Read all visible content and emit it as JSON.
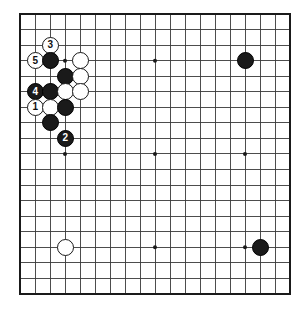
{
  "diagram": {
    "board_size": 19,
    "colors": {
      "background": "#ffffff",
      "grid_line": "#3a3a3a",
      "border_line": "#1a1a1a",
      "black_stone": "#1a1a1a",
      "white_stone": "#ffffff",
      "stone_outline": "#1a1a1a",
      "star_point": "#1a1a1a",
      "black_label_text": "#ffffff",
      "white_label_text": "#111111"
    },
    "geometry": {
      "origin_x": 20,
      "origin_y": 14,
      "step_x": 15.0,
      "step_y": 15.55,
      "stone_diameter": 17,
      "star_diameter": 4,
      "border_width": 2.2,
      "grid_width": 0.9
    },
    "star_points": [
      {
        "col": 4,
        "row": 4
      },
      {
        "col": 10,
        "row": 4
      },
      {
        "col": 16,
        "row": 4
      },
      {
        "col": 4,
        "row": 10
      },
      {
        "col": 10,
        "row": 10
      },
      {
        "col": 16,
        "row": 10
      },
      {
        "col": 4,
        "row": 16
      },
      {
        "col": 10,
        "row": 16
      },
      {
        "col": 16,
        "row": 16
      }
    ],
    "stones": [
      {
        "col": 3,
        "row": 3,
        "color": "white",
        "label": "3"
      },
      {
        "col": 2,
        "row": 4,
        "color": "white",
        "label": "5"
      },
      {
        "col": 3,
        "row": 4,
        "color": "black",
        "label": ""
      },
      {
        "col": 5,
        "row": 4,
        "color": "white",
        "label": ""
      },
      {
        "col": 4,
        "row": 5,
        "color": "black",
        "label": ""
      },
      {
        "col": 5,
        "row": 5,
        "color": "white",
        "label": ""
      },
      {
        "col": 2,
        "row": 6,
        "color": "black",
        "label": "4"
      },
      {
        "col": 3,
        "row": 6,
        "color": "black",
        "label": ""
      },
      {
        "col": 4,
        "row": 6,
        "color": "white",
        "label": ""
      },
      {
        "col": 5,
        "row": 6,
        "color": "white",
        "label": ""
      },
      {
        "col": 2,
        "row": 7,
        "color": "white",
        "label": "1"
      },
      {
        "col": 3,
        "row": 7,
        "color": "white",
        "label": ""
      },
      {
        "col": 4,
        "row": 7,
        "color": "black",
        "label": ""
      },
      {
        "col": 3,
        "row": 8,
        "color": "black",
        "label": ""
      },
      {
        "col": 4,
        "row": 9,
        "color": "black",
        "label": "2"
      },
      {
        "col": 16,
        "row": 4,
        "color": "black",
        "label": ""
      },
      {
        "col": 4,
        "row": 16,
        "color": "white",
        "label": ""
      },
      {
        "col": 17,
        "row": 16,
        "color": "black",
        "label": ""
      }
    ],
    "move_sequence": [
      {
        "number": "1",
        "color": "white",
        "col": 2,
        "row": 7
      },
      {
        "number": "2",
        "color": "black",
        "col": 4,
        "row": 9
      },
      {
        "number": "3",
        "color": "white",
        "col": 3,
        "row": 3
      },
      {
        "number": "4",
        "color": "black",
        "col": 2,
        "row": 6
      },
      {
        "number": "5",
        "color": "white",
        "col": 2,
        "row": 4
      }
    ]
  }
}
